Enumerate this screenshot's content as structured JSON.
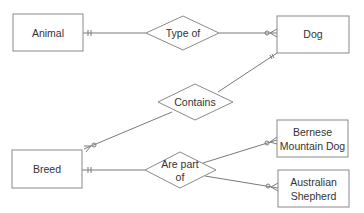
{
  "diagram": {
    "type": "entity-relationship",
    "entities": [
      {
        "id": "animal",
        "label": "Animal"
      },
      {
        "id": "dog",
        "label": "Dog"
      },
      {
        "id": "breed",
        "label": "Breed"
      },
      {
        "id": "bernese",
        "label_line1": "Bernese",
        "label_line2": "Mountain Dog"
      },
      {
        "id": "australian",
        "label_line1": "Australian",
        "label_line2": "Shepherd"
      }
    ],
    "relationships": [
      {
        "id": "type_of",
        "label": "Type of",
        "from": "Animal",
        "to": "Dog",
        "from_cardinality": "one-and-only-one",
        "to_cardinality": "zero-or-many"
      },
      {
        "id": "contains",
        "label": "Contains",
        "from": "Dog",
        "to": "Breed",
        "from_cardinality": "one-and-only-one",
        "to_cardinality": "zero-or-many"
      },
      {
        "id": "are_part_of",
        "label_line1": "Are part",
        "label_line2": "of",
        "from": "Breed",
        "to": [
          "Bernese Mountain Dog",
          "Australian Shepherd"
        ],
        "from_cardinality": "one-and-only-one",
        "to_cardinality": "zero-or-many"
      }
    ],
    "colors": {
      "stroke": "#8a8a8a",
      "text": "#333333",
      "background": "#ffffff"
    }
  }
}
